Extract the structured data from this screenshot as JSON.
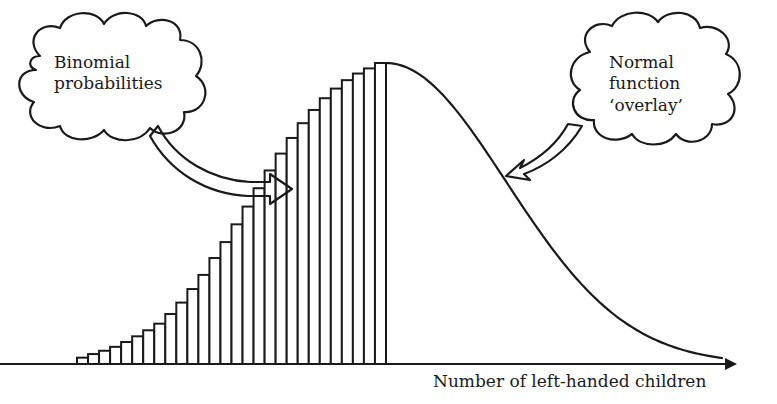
{
  "diagram": {
    "callouts": [
      {
        "id": "binomial",
        "lines": [
          "Binomial",
          "probabilities"
        ]
      },
      {
        "id": "normal",
        "lines": [
          "Normal",
          "function",
          "‘overlay’"
        ]
      }
    ],
    "x_axis_label": "Number of left-handed children",
    "colors": {
      "ink": "#1a1a1a",
      "background": "#ffffff"
    }
  },
  "chart_data": {
    "type": "bar",
    "title": "",
    "xlabel": "Number of left-handed children",
    "ylabel": "",
    "grid": false,
    "legend": "none",
    "bars": {
      "count": 28,
      "relative_heights": [
        0.021,
        0.033,
        0.044,
        0.057,
        0.073,
        0.092,
        0.112,
        0.134,
        0.166,
        0.204,
        0.249,
        0.296,
        0.352,
        0.405,
        0.464,
        0.523,
        0.584,
        0.643,
        0.699,
        0.751,
        0.8,
        0.844,
        0.883,
        0.915,
        0.943,
        0.965,
        0.982,
        1.0
      ]
    },
    "overlay_curve": {
      "type": "normal",
      "peak_at_bar": 28,
      "note": "descends from peak to near zero at the right end of the axis"
    },
    "annotations": [
      {
        "text": "Binomial probabilities",
        "points_to": "histogram bars"
      },
      {
        "text": "Normal function ‘overlay’",
        "points_to": "normal curve"
      }
    ]
  }
}
